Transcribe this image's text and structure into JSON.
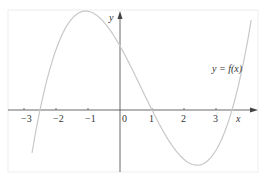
{
  "chart_data": {
    "type": "line",
    "title": "",
    "xlabel": "x",
    "ylabel": "y",
    "curve_label": "y = f(x)",
    "x_ticks": [
      "-3",
      "-2",
      "-1",
      "0",
      "1",
      "2",
      "3"
    ],
    "xlim": [
      -3.6,
      4.2
    ],
    "ylim": [
      -2.0,
      3.1
    ],
    "grid": false,
    "series": [
      {
        "name": "y = f(x)",
        "shape": "cubic",
        "roots": [
          -2.5,
          1,
          3.5
        ],
        "y_intercept": 2,
        "local_max": {
          "x": -0.75,
          "y": 2.65
        },
        "local_min": {
          "x": 2.25,
          "y": -1.47
        },
        "x": [
          -2.75,
          -2.5,
          -2,
          -1.5,
          -1,
          -0.75,
          -0.5,
          0,
          0.5,
          1,
          1.5,
          2,
          2.25,
          2.5,
          3,
          3.5,
          4.0
        ],
        "y": [
          -0.55,
          0,
          1.15,
          2.05,
          2.55,
          2.65,
          2.6,
          2.0,
          1.1,
          0,
          -0.85,
          -1.4,
          -1.47,
          -1.4,
          -0.95,
          0,
          1.55
        ]
      }
    ],
    "colors": {
      "curve": "#c8c8c8",
      "axes": "#444444",
      "frame": "#eeeeee"
    }
  }
}
